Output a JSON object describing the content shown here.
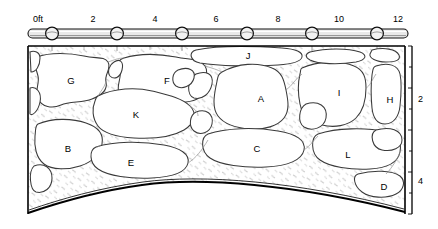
{
  "figure": {
    "type": "technical-line-drawing"
  },
  "horizontal_scale": {
    "name": "horizontal-ruler",
    "unit": "ft",
    "ticks": [
      {
        "label": "0ft",
        "value": 0,
        "x": 33
      },
      {
        "label": "2",
        "value": 2,
        "x": 93
      },
      {
        "label": "4",
        "value": 4,
        "x": 155
      },
      {
        "label": "6",
        "value": 6,
        "x": 216
      },
      {
        "label": "8",
        "value": 8,
        "x": 278
      },
      {
        "label": "10",
        "value": 10,
        "x": 339
      },
      {
        "label": "12",
        "value": 12,
        "x": 401
      }
    ],
    "marker_centers_x": [
      52,
      117,
      182,
      247,
      312,
      377
    ],
    "bar_y": 33
  },
  "vertical_scale": {
    "name": "vertical-ruler",
    "unit": "ft",
    "ticks": [
      {
        "label": "2",
        "value": 2,
        "y": 99
      },
      {
        "label": "4",
        "value": 4,
        "y": 181
      }
    ],
    "axis_x": 412
  },
  "stones": [
    {
      "id": "G",
      "label": "G",
      "x": 71,
      "y": 81
    },
    {
      "id": "F",
      "label": "F",
      "x": 167,
      "y": 81
    },
    {
      "id": "J",
      "label": "J",
      "x": 248,
      "y": 56
    },
    {
      "id": "A",
      "label": "A",
      "x": 261,
      "y": 99
    },
    {
      "id": "I",
      "label": "I",
      "x": 339,
      "y": 93
    },
    {
      "id": "H",
      "label": "H",
      "x": 390,
      "y": 100
    },
    {
      "id": "K",
      "label": "K",
      "x": 136,
      "y": 115
    },
    {
      "id": "B",
      "label": "B",
      "x": 68,
      "y": 149
    },
    {
      "id": "E",
      "label": "E",
      "x": 131,
      "y": 163
    },
    {
      "id": "C",
      "label": "C",
      "x": 257,
      "y": 149
    },
    {
      "id": "L",
      "label": "L",
      "x": 348,
      "y": 155
    },
    {
      "id": "D",
      "label": "D",
      "x": 384,
      "y": 187
    }
  ],
  "frame": {
    "left": 28,
    "right": 405,
    "top": 46,
    "bottom": 214,
    "arch_springline_left_y": 212,
    "arch_crown_y": 178
  },
  "colors": {
    "ink": "#000000",
    "stone_outline": "#3a3a3a",
    "mortar_hatch": "#9a9a9a",
    "paper": "#ffffff",
    "ruler_fill": "#e9e9e9"
  }
}
